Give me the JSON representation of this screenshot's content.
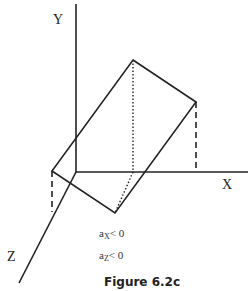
{
  "figure": {
    "caption": "Figure 6.2c",
    "axes": {
      "x_label": "X",
      "y_label": "Y",
      "z_label": "Z"
    },
    "conditions": [
      {
        "var": "a",
        "sub": "X",
        "relation": "< 0"
      },
      {
        "var": "a",
        "sub": "Z",
        "relation": "< 0"
      }
    ],
    "shape": {
      "type": "parallelogram",
      "vertices": {
        "top": [
          133,
          60
        ],
        "right": [
          196,
          102
        ],
        "bottom": [
          115,
          213
        ],
        "left": [
          52,
          171
        ]
      }
    },
    "colors": {
      "line": "#222222",
      "background": "#ffffff"
    }
  }
}
